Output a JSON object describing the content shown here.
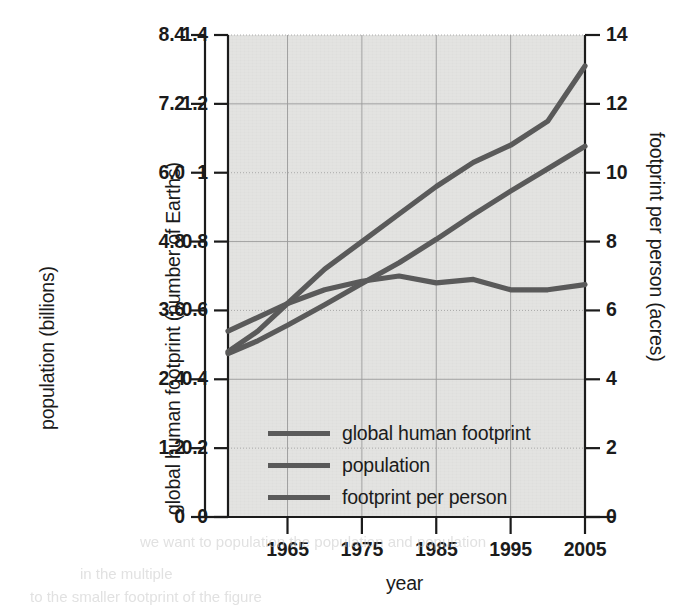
{
  "chart_data": {
    "type": "line",
    "title": "",
    "xlabel": "year",
    "x": [
      1957,
      1961,
      1965,
      1970,
      1975,
      1980,
      1985,
      1990,
      1995,
      2000,
      2005
    ],
    "axes": {
      "left_outer": {
        "label": "population (billions)",
        "ticks": [
          "8.4",
          "7.2",
          "6.0",
          "4.8",
          "3.6",
          "2.4",
          "1.2",
          "0"
        ],
        "values": [
          8.4,
          7.2,
          6.0,
          4.8,
          3.6,
          2.4,
          1.2,
          0
        ],
        "min": 0,
        "max": 8.4,
        "step": 1.2
      },
      "left_inner": {
        "label": "global human footprint (number of Earths)",
        "ticks": [
          "1.4",
          "1.2",
          "1",
          "0.8",
          "0.6",
          "0.4",
          "0.2",
          "0"
        ],
        "values": [
          1.4,
          1.2,
          1.0,
          0.8,
          0.6,
          0.4,
          0.2,
          0
        ],
        "min": 0,
        "max": 1.4,
        "step": 0.2
      },
      "right": {
        "label": "footprint per person (acres)",
        "ticks": [
          "14",
          "12",
          "10",
          "8",
          "6",
          "4",
          "2",
          "0"
        ],
        "values": [
          14,
          12,
          10,
          8,
          6,
          4,
          2,
          0
        ],
        "min": 0,
        "max": 14,
        "step": 2
      },
      "x_axis": {
        "label": "year",
        "ticks": [
          "1965",
          "1975",
          "1985",
          "1995",
          "2005"
        ],
        "values": [
          1965,
          1975,
          1985,
          1995,
          2005
        ],
        "min": 1957,
        "max": 2005
      }
    },
    "grid": true,
    "legend_position": "inside lower-left",
    "series": [
      {
        "name": "global human footprint",
        "axis": "left_inner",
        "unit": "number of Earths",
        "color": "#5a5a5a",
        "values": [
          0.48,
          0.54,
          0.62,
          0.72,
          0.8,
          0.88,
          0.96,
          1.03,
          1.08,
          1.15,
          1.31
        ]
      },
      {
        "name": "population",
        "axis": "left_outer",
        "unit": "billions",
        "color": "#5a5a5a",
        "values": [
          2.85,
          3.07,
          3.34,
          3.7,
          4.07,
          4.43,
          4.84,
          5.27,
          5.68,
          6.07,
          6.46
        ]
      },
      {
        "name": "footprint per person",
        "axis": "right",
        "unit": "acres",
        "color": "#5a5a5a",
        "values": [
          5.4,
          5.8,
          6.2,
          6.6,
          6.85,
          7.0,
          6.8,
          6.9,
          6.6,
          6.6,
          6.75
        ]
      }
    ]
  },
  "legend": {
    "items": [
      {
        "label": "global human footprint",
        "color": "#5a5a5a"
      },
      {
        "label": "population",
        "color": "#5a5a5a"
      },
      {
        "label": "footprint per person",
        "color": "#5a5a5a"
      }
    ]
  },
  "bleed_text": {
    "line1": "we want to population the population and population",
    "line2": "in the multiple",
    "line3": "to the smaller footprint of the figure"
  }
}
